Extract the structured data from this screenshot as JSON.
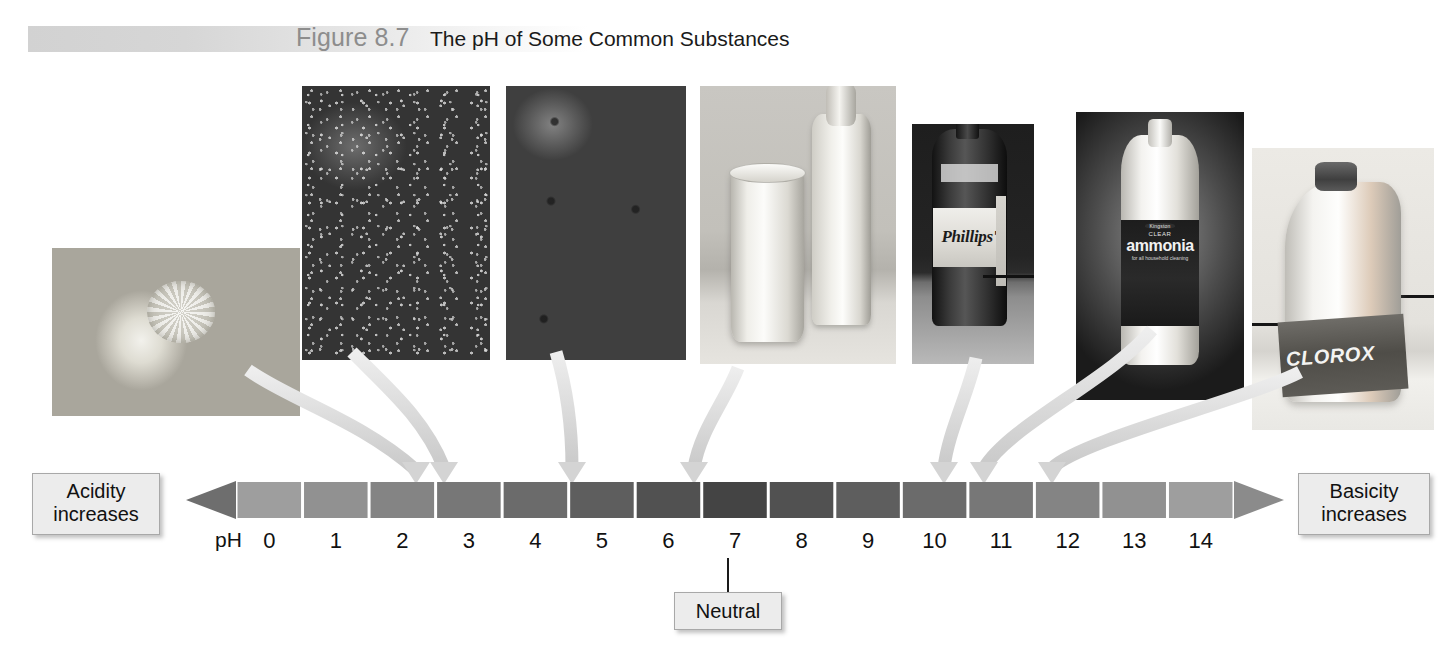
{
  "header": {
    "figure_number": "Figure 8.7",
    "caption": "The pH of Some Common Substances"
  },
  "callouts": {
    "acidity": "Acidity\nincreases",
    "acidity_line1": "Acidity",
    "acidity_line2": "increases",
    "basicity_line1": "Basicity",
    "basicity_line2": "increases",
    "neutral": "Neutral"
  },
  "scale": {
    "axis_label": "pH",
    "ticks": [
      "0",
      "1",
      "2",
      "3",
      "4",
      "5",
      "6",
      "7",
      "8",
      "9",
      "10",
      "11",
      "12",
      "13",
      "14"
    ],
    "left_arrow_direction": "left",
    "right_arrow_direction": "right",
    "neutral_value": "7",
    "bar_color_light": "#9a9a9a",
    "bar_color_dark": "#4a4a4a"
  },
  "photos": [
    {
      "name": "lemons",
      "subject": "Lemons",
      "ph_target": "2.4",
      "label_text": ""
    },
    {
      "name": "strawberries",
      "subject": "Strawberries",
      "ph_target": "3.4",
      "label_text": ""
    },
    {
      "name": "tomatoes",
      "subject": "Tomatoes",
      "ph_target": "4.2",
      "label_text": ""
    },
    {
      "name": "milk",
      "subject": "Milk",
      "ph_target": "6.6",
      "label_text": ""
    },
    {
      "name": "phillips",
      "subject": "Milk of Magnesia",
      "ph_target": "10.5",
      "label_text": "Phillips'"
    },
    {
      "name": "ammonia",
      "subject": "Household Ammonia",
      "ph_target": "11.2",
      "label_brand": "Kingston",
      "label_clear": "CLEAR",
      "label_text": "ammonia",
      "label_sub": "for all household cleaning"
    },
    {
      "name": "clorox",
      "subject": "Bleach",
      "ph_target": "12.3",
      "label_text": "CLOROX"
    }
  ],
  "chart_data": {
    "type": "bar",
    "title": "The pH of Some Common Substances",
    "xlabel": "pH",
    "ylabel": "",
    "categories": [
      "0",
      "1",
      "2",
      "3",
      "4",
      "5",
      "6",
      "7",
      "8",
      "9",
      "10",
      "11",
      "12",
      "13",
      "14"
    ],
    "values": [
      0,
      1,
      2,
      3,
      4,
      5,
      6,
      7,
      8,
      9,
      10,
      11,
      12,
      13,
      14
    ],
    "xlim": [
      0,
      14
    ],
    "grid": false,
    "legend": "none",
    "annotations": [
      {
        "label": "Lemons",
        "ph": 2.4
      },
      {
        "label": "Strawberries",
        "ph": 3.4
      },
      {
        "label": "Tomatoes",
        "ph": 4.2
      },
      {
        "label": "Milk",
        "ph": 6.6
      },
      {
        "label": "Milk of Magnesia",
        "ph": 10.5
      },
      {
        "label": "Household Ammonia",
        "ph": 11.2
      },
      {
        "label": "Bleach",
        "ph": 12.3
      }
    ],
    "axis_end_labels": {
      "left": "Acidity increases",
      "right": "Basicity increases"
    },
    "marker": {
      "label": "Neutral",
      "ph": 7
    }
  }
}
